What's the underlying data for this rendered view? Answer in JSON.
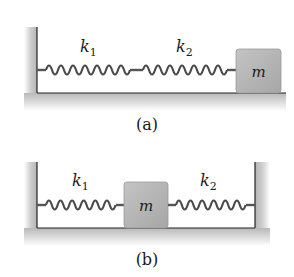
{
  "figure": {
    "panels": [
      {
        "id": "a",
        "caption": "(a)",
        "springs": [
          {
            "label": "k",
            "subscript": "1"
          },
          {
            "label": "k",
            "subscript": "2"
          }
        ],
        "mass_label": "m",
        "arrangement": "wall - k1 - k2 - mass (series)"
      },
      {
        "id": "b",
        "caption": "(b)",
        "springs": [
          {
            "label": "k",
            "subscript": "1"
          },
          {
            "label": "k",
            "subscript": "2"
          }
        ],
        "mass_label": "m",
        "arrangement": "wall - k1 - mass - k2 - wall (parallel)"
      }
    ],
    "colors": {
      "wall_shade": "#c8c8c8",
      "block_fill": "#b3b3b3",
      "spring": "#555555",
      "line": "#222222"
    }
  }
}
